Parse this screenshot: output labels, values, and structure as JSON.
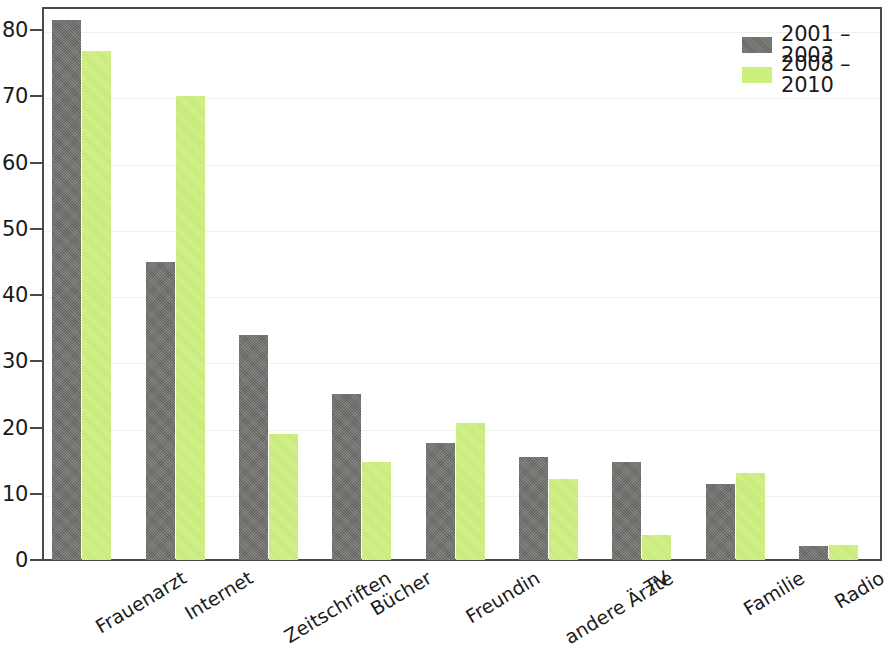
{
  "chart_data": {
    "type": "bar",
    "title": "",
    "xlabel": "",
    "ylabel": "",
    "ylim": [
      0,
      83.5
    ],
    "grid": true,
    "legend_position": "top-right",
    "yticks": [
      0,
      10,
      20,
      30,
      40,
      50,
      60,
      70,
      80
    ],
    "ytick_labels": [
      "0",
      "10",
      "20",
      "30",
      "40",
      "50",
      "60",
      "70",
      "80"
    ],
    "categories": [
      "Frauenarzt",
      "Internet",
      "Zeitschriften",
      "Bücher",
      "Freundin",
      "andere Ärzte",
      "TV",
      "Familie",
      "Radio"
    ],
    "series": [
      {
        "name": "2001 – 2003",
        "color": "#6e6e6b",
        "values": [
          81.5,
          45.0,
          34.0,
          25.0,
          17.7,
          15.6,
          14.8,
          11.5,
          2.1
        ]
      },
      {
        "name": "2008 – 2010",
        "color": "#cdf07c",
        "values": [
          76.8,
          70.0,
          19.0,
          14.8,
          20.7,
          12.2,
          3.8,
          13.2,
          2.3
        ]
      }
    ]
  },
  "legend": {
    "entries": [
      {
        "label": "2001 – 2003"
      },
      {
        "label": "2008 – 2010"
      }
    ]
  }
}
